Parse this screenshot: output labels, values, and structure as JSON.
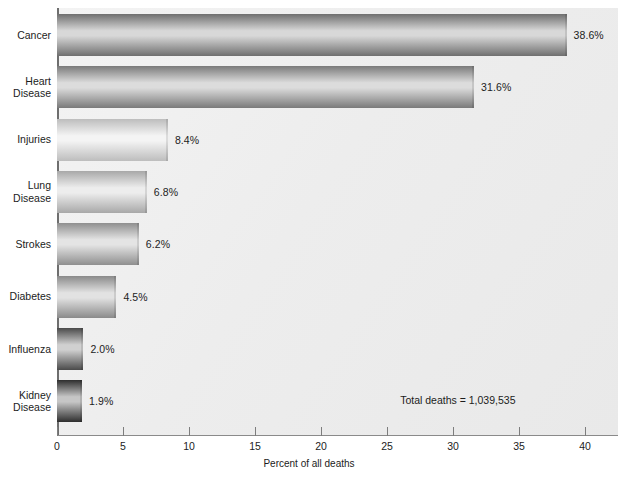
{
  "chart_data": {
    "type": "bar",
    "orientation": "horizontal",
    "title": "",
    "xlabel": "Percent of all deaths",
    "ylabel": "",
    "xlim": [
      0,
      40
    ],
    "xticks": [
      0,
      5,
      10,
      15,
      20,
      25,
      30,
      35,
      40
    ],
    "xtick_labels": [
      "0",
      "5",
      "10",
      "15",
      "20",
      "25",
      "30",
      "35",
      "40"
    ],
    "grid": false,
    "legend": null,
    "categories": [
      "Cancer",
      "Heart\nDisease",
      "Injuries",
      "Lung\nDisease",
      "Strokes",
      "Diabetes",
      "Influenza",
      "Kidney\nDisease"
    ],
    "values": [
      38.6,
      31.6,
      8.4,
      6.8,
      6.2,
      4.5,
      2.0,
      1.9
    ],
    "value_labels": [
      "38.6%",
      "31.6%",
      "8.4%",
      "6.8%",
      "6.2%",
      "4.5%",
      "2.0%",
      "1.9%"
    ],
    "annotations": [
      {
        "text": "Total deaths = 1,039,535",
        "x": 26.0,
        "y": 7
      }
    ],
    "bar_shades": [
      {
        "edge": "#6f6f6f",
        "mid": "#d8d8d8"
      },
      {
        "edge": "#7a7a7a",
        "mid": "#dcdcdc"
      },
      {
        "edge": "#bdbdbd",
        "mid": "#f4f4f4"
      },
      {
        "edge": "#a8a8a8",
        "mid": "#ededed"
      },
      {
        "edge": "#8f8f8f",
        "mid": "#e4e4e4"
      },
      {
        "edge": "#8a8a8a",
        "mid": "#e2e2e2"
      },
      {
        "edge": "#4a4a4a",
        "mid": "#d0d0d0"
      },
      {
        "edge": "#2e2e2e",
        "mid": "#c6c6c6"
      }
    ],
    "plot_background": "#eeeeee",
    "page_background": "#ffffff",
    "axis_color": "#6e6e6e"
  },
  "labels": {
    "x_axis_title": "Percent of all deaths",
    "total_deaths": "Total deaths = 1,039,535"
  }
}
